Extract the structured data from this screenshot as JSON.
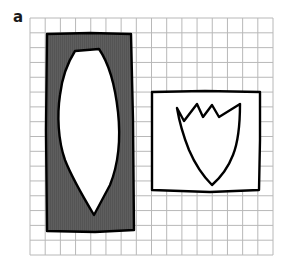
{
  "panel": {
    "label": "a"
  },
  "grid": {
    "x0": 30,
    "y0": 18,
    "x1": 273,
    "y1": 255,
    "cols": 16,
    "rows": 16,
    "line_color": "#b8b8b8"
  },
  "shapes": {
    "dark_rectangle": {
      "fill": "#5a5a5a",
      "stroke": "#000000",
      "inner_shape": "pointed-oval",
      "inner_fill": "#ffffff"
    },
    "white_rectangle": {
      "fill": "#ffffff",
      "stroke": "#000000",
      "inner_shape": "tulip",
      "inner_fill": "#ffffff"
    }
  }
}
